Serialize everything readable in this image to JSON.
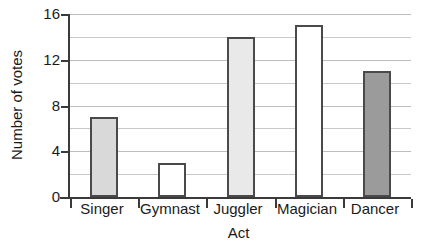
{
  "chart_data": {
    "type": "bar",
    "title": "",
    "subtitle": "",
    "xlabel": "Act",
    "ylabel": "Number of votes",
    "categories": [
      "Singer",
      "Gymnast",
      "Juggler",
      "Magician",
      "Dancer"
    ],
    "values": [
      7,
      3,
      14,
      15,
      11
    ],
    "ylim": [
      0,
      16
    ],
    "y_major_ticks": [
      0,
      4,
      8,
      12,
      16
    ],
    "y_major_tick_labels": [
      "0",
      "4",
      "8",
      "12",
      "16"
    ],
    "y_gridlines": [
      2,
      4,
      6,
      8,
      10,
      12,
      14,
      16
    ],
    "grid": true,
    "legend": false,
    "legend_position": "none",
    "bar_colors": [
      "#d9d9d9",
      "#ffffff",
      "#e9e9e9",
      "#ffffff",
      "#9b9b9b"
    ],
    "bar_border_color": "#4a4a4a",
    "axis_color": "#3a3a3a",
    "gridline_color": "#c9c9c9",
    "background_color": "#ffffff",
    "text_color": "#1a1a1a",
    "bars": [
      {
        "category": "Singer",
        "value": 7,
        "color": "#d9d9d9"
      },
      {
        "category": "Gymnast",
        "value": 3,
        "color": "#ffffff"
      },
      {
        "category": "Juggler",
        "value": 14,
        "color": "#e9e9e9"
      },
      {
        "category": "Magician",
        "value": 15,
        "color": "#ffffff"
      },
      {
        "category": "Dancer",
        "value": 11,
        "color": "#9b9b9b"
      }
    ]
  }
}
